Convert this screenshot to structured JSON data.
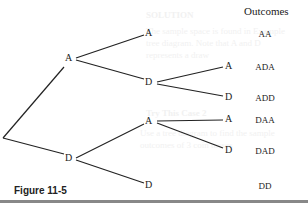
{
  "background_text": {
    "heading1": "SOLUTION",
    "line1": "The sample space is found in Example",
    "line2": "tree diagram. Note that A and D",
    "line3": "represents a draw",
    "heading2": "Try This Case 2",
    "line4": "Use a tree diagram to find the sample",
    "line5": "outcomes of 3 coin tosses"
  },
  "diagram": {
    "outcomes_header": "Outcomes",
    "nodes": {
      "l1_a": "A",
      "l1_d": "D",
      "l2_aa": "A",
      "l2_ad": "D",
      "l2_da": "A",
      "l2_dd": "D",
      "l3_ada": "A",
      "l3_add": "D",
      "l3_daa": "A",
      "l3_dad": "D"
    },
    "outcomes": [
      "AA",
      "ADA",
      "ADD",
      "DAA",
      "DAD",
      "DD"
    ],
    "caption": "Figure 11-5",
    "line_color": "#222222"
  }
}
